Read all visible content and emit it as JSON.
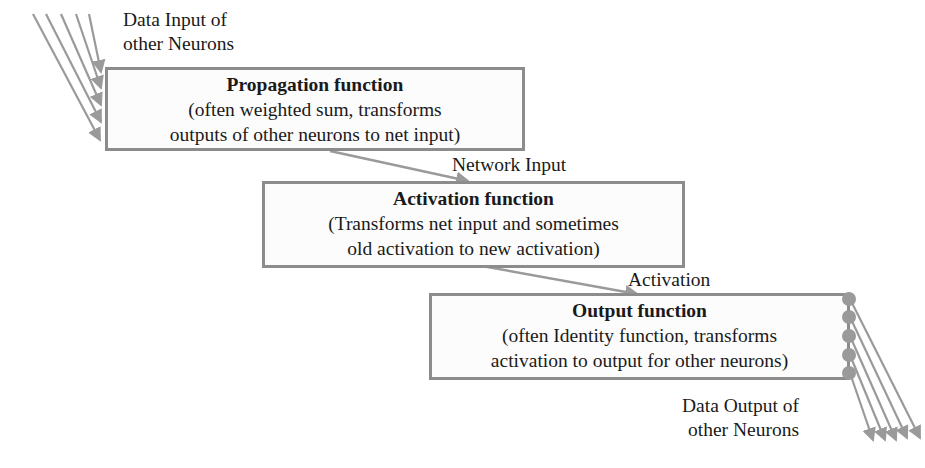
{
  "diagram": {
    "input_label": {
      "line1": "Data Input of",
      "line2": "other Neurons"
    },
    "propagation": {
      "title": "Propagation function",
      "line1": "(often weighted sum, transforms",
      "line2": "outputs of other neurons to net input)"
    },
    "network_input_label": "Network Input",
    "activation": {
      "title": "Activation function",
      "line1": "(Transforms net input and sometimes",
      "line2": "old activation to new activation)"
    },
    "activation_label": "Activation",
    "output": {
      "title": "Output function",
      "line1": "(often Identity function, transforms",
      "line2": "activation to output for other neurons)"
    },
    "output_label": {
      "line1": "Data Output of",
      "line2": "other Neurons"
    },
    "colors": {
      "line": "#9a9a9a",
      "border": "#8c8c8c",
      "text": "#1a1a1a"
    }
  }
}
